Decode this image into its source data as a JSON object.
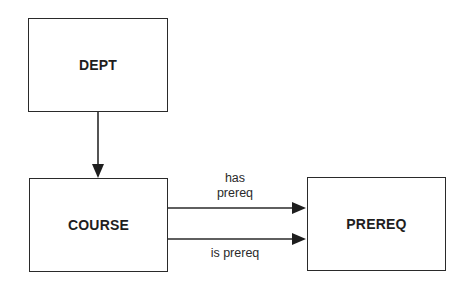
{
  "diagram": {
    "nodes": [
      {
        "id": "dept",
        "label": "DEPT"
      },
      {
        "id": "course",
        "label": "COURSE"
      },
      {
        "id": "prereq",
        "label": "PREREQ"
      }
    ],
    "edges": [
      {
        "from": "dept",
        "to": "course",
        "label": ""
      },
      {
        "from": "course",
        "to": "prereq",
        "label_line1": "has",
        "label_line2": "prereq"
      },
      {
        "from": "course",
        "to": "prereq",
        "label": "is prereq"
      }
    ]
  }
}
